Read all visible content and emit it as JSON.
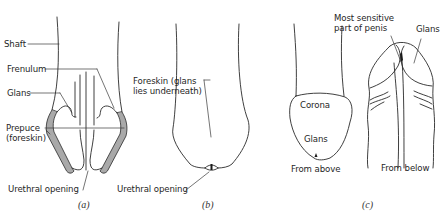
{
  "figure": {
    "panels": [
      {
        "id": "a",
        "caption": "(a)",
        "labels": {
          "shaft": "Shaft",
          "frenulum": "Frenulum",
          "glans": "Glans",
          "prepuce_line1": "Prepuce",
          "prepuce_line2": "(foreskin)",
          "urethral_opening": "Urethral opening"
        }
      },
      {
        "id": "b",
        "caption": "(b)",
        "labels": {
          "foreskin_line1": "Foreskin (glans",
          "foreskin_line2": "lies underneath)",
          "urethral_opening": "Urethral opening"
        }
      },
      {
        "id": "c",
        "caption": "(c)",
        "labels": {
          "sensitive_line1": "Most sensitive",
          "sensitive_line2": "part of penis",
          "glans_top": "Glans",
          "corona": "Corona",
          "glans_inner": "Glans",
          "from_above": "From above",
          "from_below": "From below"
        }
      }
    ]
  },
  "colors": {
    "line": "#2a2a2a",
    "shading": "#a9a9a9",
    "background": "#ffffff"
  }
}
